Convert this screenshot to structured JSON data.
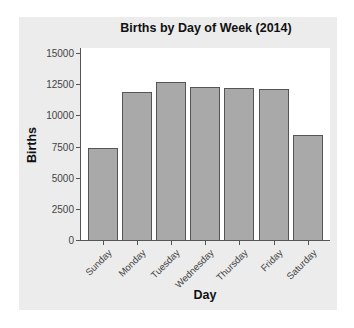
{
  "chart_data": {
    "type": "bar",
    "title": "Births by Day of Week (2014)",
    "xlabel": "Day",
    "ylabel": "Births",
    "categories": [
      "Sunday",
      "Monday",
      "Tuesday",
      "Wednesday",
      "Thursday",
      "Friday",
      "Saturday"
    ],
    "values": [
      7380,
      11850,
      12650,
      12250,
      12170,
      12090,
      8400
    ],
    "ylim": [
      0,
      15000
    ],
    "yticks": [
      0,
      2500,
      5000,
      7500,
      10000,
      12500,
      15000
    ],
    "grid": false,
    "legend": null,
    "colors": {
      "bar_fill": "#a9a9a9",
      "bar_border": "#555555",
      "panel": "#ececec",
      "plot_bg": "#ffffff"
    }
  }
}
